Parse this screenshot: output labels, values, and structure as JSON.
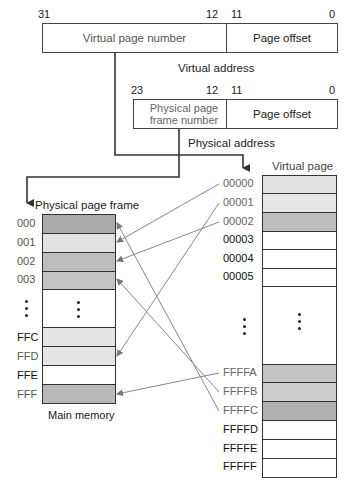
{
  "virtual_address": {
    "bits": {
      "high": "31",
      "split_high": "12",
      "split_low": "11",
      "low": "0"
    },
    "field_page_number": "Virtual page number",
    "field_offset": "Page offset",
    "caption": "Virtual address"
  },
  "physical_address": {
    "bits": {
      "high": "23",
      "split_high": "12",
      "split_low": "11",
      "low": "0"
    },
    "field_frame_number": "Physical page frame number",
    "field_offset": "Page offset",
    "caption": "Physical address"
  },
  "physical_memory": {
    "title": "Physical page frame",
    "caption": "Main memory",
    "rows": [
      {
        "label": "000",
        "fill": "#a9a9a9",
        "mapped": true
      },
      {
        "label": "001",
        "fill": "#e2e2e2",
        "mapped": true
      },
      {
        "label": "002",
        "fill": "#bdbdbd",
        "mapped": true
      },
      {
        "label": "003",
        "fill": "#c3c3c3",
        "mapped": true
      },
      {
        "label": "⋮",
        "fill": "#ffffff",
        "ellipsis": true
      },
      {
        "label": "FFC",
        "fill": "#e4e4e4",
        "mapped": false
      },
      {
        "label": "FFD",
        "fill": "#e4e4e4",
        "mapped": true
      },
      {
        "label": "FFE",
        "fill": "#ffffff",
        "mapped": false
      },
      {
        "label": "FFF",
        "fill": "#b9b9b9",
        "mapped": true
      }
    ]
  },
  "virtual_memory": {
    "title": "Virtual page",
    "rows": [
      {
        "label": "00000",
        "fill": "#e2e2e2",
        "mapped": true
      },
      {
        "label": "00001",
        "fill": "#e6e6e6",
        "mapped": true
      },
      {
        "label": "00002",
        "fill": "#bdbdbd",
        "mapped": true
      },
      {
        "label": "00003",
        "fill": "#ffffff",
        "mapped": false
      },
      {
        "label": "00004",
        "fill": "#ffffff",
        "mapped": false
      },
      {
        "label": "00005",
        "fill": "#ffffff",
        "mapped": false
      },
      {
        "label": "⋮",
        "fill": "#ffffff",
        "ellipsis": true
      },
      {
        "label": "FFFFA",
        "fill": "#c4c4c4",
        "mapped": true
      },
      {
        "label": "FFFFB",
        "fill": "#cbcbcb",
        "mapped": true
      },
      {
        "label": "FFFFC",
        "fill": "#b0b0b0",
        "mapped": true
      },
      {
        "label": "FFFFD",
        "fill": "#ffffff",
        "mapped": false
      },
      {
        "label": "FFFFE",
        "fill": "#ffffff",
        "mapped": false
      },
      {
        "label": "FFFFF",
        "fill": "#ffffff",
        "mapped": false
      }
    ]
  },
  "mappings": [
    {
      "virtual": "00000",
      "physical": "001"
    },
    {
      "virtual": "00001",
      "physical": "FFD"
    },
    {
      "virtual": "00002",
      "physical": "002"
    },
    {
      "virtual": "FFFFA",
      "physical": "FFF"
    },
    {
      "virtual": "FFFFB",
      "physical": "003"
    },
    {
      "virtual": "FFFFC",
      "physical": "000"
    }
  ],
  "colors": {
    "line": "#333333",
    "arrow": "#777777",
    "mapped_label": "#666666",
    "unmapped_label": "#111111"
  }
}
